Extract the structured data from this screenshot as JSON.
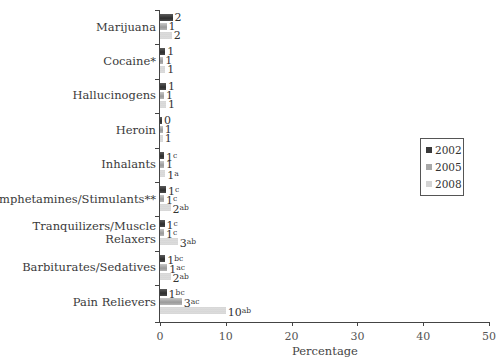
{
  "chart_data": {
    "type": "bar",
    "orientation": "horizontal",
    "title": "",
    "xlabel": "Percentage",
    "ylabel": "",
    "xlim": [
      0,
      50
    ],
    "xticks": [
      0,
      10,
      20,
      30,
      40,
      50
    ],
    "grid": false,
    "legend_position": "right",
    "categories": [
      "Marijuana",
      "Cocaine*",
      "Hallucinogens",
      "Heroin",
      "Inhalants",
      "Amphetamines/Stimulants**",
      "Tranquilizers/Muscle Relaxers",
      "Barbiturates/Sedatives",
      "Pain Relievers"
    ],
    "series": [
      {
        "name": "2002",
        "color": "#3a3a3a",
        "values": [
          2,
          1,
          1,
          0,
          1,
          1,
          1,
          1,
          1
        ],
        "superscripts": [
          "",
          "",
          "",
          "",
          "c",
          "c",
          "c",
          "bc",
          "bc"
        ]
      },
      {
        "name": "2005",
        "color": "#a8a8a8",
        "values": [
          1,
          1,
          1,
          1,
          1,
          1,
          1,
          1,
          3
        ],
        "superscripts": [
          "",
          "",
          "",
          "",
          "",
          "c",
          "c",
          "ac",
          "ac"
        ]
      },
      {
        "name": "2008",
        "color": "#dcdcdc",
        "values": [
          2,
          1,
          1,
          1,
          1,
          2,
          3,
          2,
          10
        ],
        "superscripts": [
          "",
          "",
          "",
          "",
          "a",
          "ab",
          "ab",
          "ab",
          "ab"
        ]
      }
    ],
    "bar_lengths_estimated": {
      "2002": [
        1.9,
        0.8,
        0.9,
        0.3,
        0.6,
        0.9,
        0.7,
        0.8,
        1.0
      ],
      "2005": [
        1.0,
        0.5,
        0.6,
        0.4,
        0.6,
        0.6,
        0.6,
        1.1,
        3.3
      ],
      "2008": [
        1.8,
        0.8,
        0.9,
        0.4,
        0.8,
        1.6,
        2.7,
        1.6,
        10.0
      ]
    }
  },
  "labels": {
    "categories_display": [
      [
        "Marijuana"
      ],
      [
        "Cocaine*"
      ],
      [
        "Hallucinogens"
      ],
      [
        "Heroin"
      ],
      [
        "Inhalants"
      ],
      [
        "Amphetamines/Stimulants**"
      ],
      [
        "Tranquilizers/Muscle",
        "Relaxers"
      ],
      [
        "Barbiturates/Sedatives"
      ],
      [
        "Pain Relievers"
      ]
    ],
    "xticks": [
      "0",
      "10",
      "20",
      "30",
      "40",
      "50"
    ],
    "legend": [
      "2002",
      "2005",
      "2008"
    ]
  }
}
